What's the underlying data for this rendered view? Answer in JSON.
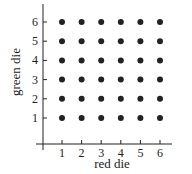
{
  "chart_data": {
    "type": "scatter",
    "title": "",
    "xlabel": "red die",
    "ylabel": "green die",
    "x_ticks": [
      "1",
      "2",
      "3",
      "4",
      "5",
      "6"
    ],
    "y_ticks": [
      "1",
      "2",
      "3",
      "4",
      "5",
      "6"
    ],
    "xlim": [
      0,
      7
    ],
    "ylim": [
      0,
      6.6
    ],
    "grid": false,
    "legend": null,
    "series": [
      {
        "name": "outcomes",
        "color": "#222222",
        "points": [
          [
            1,
            1
          ],
          [
            2,
            1
          ],
          [
            3,
            1
          ],
          [
            4,
            1
          ],
          [
            5,
            1
          ],
          [
            6,
            1
          ],
          [
            1,
            2
          ],
          [
            2,
            2
          ],
          [
            3,
            2
          ],
          [
            4,
            2
          ],
          [
            5,
            2
          ],
          [
            6,
            2
          ],
          [
            1,
            3
          ],
          [
            2,
            3
          ],
          [
            3,
            3
          ],
          [
            4,
            3
          ],
          [
            5,
            3
          ],
          [
            6,
            3
          ],
          [
            1,
            4
          ],
          [
            2,
            4
          ],
          [
            3,
            4
          ],
          [
            4,
            4
          ],
          [
            5,
            4
          ],
          [
            6,
            4
          ],
          [
            1,
            5
          ],
          [
            2,
            5
          ],
          [
            3,
            5
          ],
          [
            4,
            5
          ],
          [
            5,
            5
          ],
          [
            6,
            5
          ],
          [
            1,
            6
          ],
          [
            2,
            6
          ],
          [
            3,
            6
          ],
          [
            4,
            6
          ],
          [
            5,
            6
          ],
          [
            6,
            6
          ]
        ]
      }
    ]
  }
}
